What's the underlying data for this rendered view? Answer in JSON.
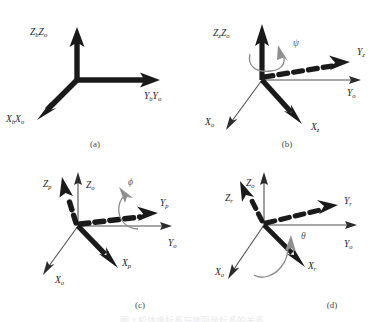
{
  "figure": {
    "background_color": "#ffffff",
    "solid_color": "#1a1a1a",
    "thin_color": "#555555",
    "angle_color": "#8a8a8a",
    "bottom_caption": "图 2  机体坐标系与地面坐标系的关系",
    "panels": [
      {
        "id": "a",
        "caption": "(a)",
        "labels": [
          {
            "name": "z-axis-label",
            "base": "Z",
            "sub": "b",
            "base2": "Z",
            "sub2": "o",
            "x": 30,
            "y": 35
          },
          {
            "name": "y-axis-label",
            "base": "Y",
            "sub": "b",
            "base2": "Y",
            "sub2": "o",
            "x": 144,
            "y": 99
          },
          {
            "name": "x-axis-label",
            "base": "X",
            "sub": "b",
            "base2": "X",
            "sub2": "o",
            "x": 6,
            "y": 122
          }
        ]
      },
      {
        "id": "b",
        "caption": "(b)",
        "angle_symbol": "ψ",
        "labels": [
          {
            "name": "z-axis-label",
            "base": "Z",
            "sub": "z",
            "base2": "Z",
            "sub2": "o",
            "x": 21,
            "y": 36
          },
          {
            "name": "y-body-label",
            "base": "Y",
            "sub": "z",
            "x": 165,
            "y": 55
          },
          {
            "name": "y-ground-label",
            "base": "Y",
            "sub": "o",
            "x": 155,
            "y": 96
          },
          {
            "name": "x-ground-label",
            "base": "X",
            "sub": "o",
            "x": 13,
            "y": 125
          },
          {
            "name": "x-body-label",
            "base": "X",
            "sub": "z",
            "x": 119,
            "y": 130
          }
        ]
      },
      {
        "id": "c",
        "caption": "(c)",
        "angle_symbol": "ϕ",
        "labels": [
          {
            "name": "z-body-label",
            "base": "Z",
            "sub": "p",
            "x": 43,
            "y": 26
          },
          {
            "name": "z-ground-label",
            "base": "Z",
            "sub": "o",
            "x": 86,
            "y": 27
          },
          {
            "name": "y-body-label",
            "base": "Y",
            "sub": "p",
            "x": 160,
            "y": 45
          },
          {
            "name": "y-ground-label",
            "base": "Y",
            "sub": "o",
            "x": 168,
            "y": 85
          },
          {
            "name": "x-body-label",
            "base": "X",
            "sub": "p",
            "x": 122,
            "y": 105
          },
          {
            "name": "x-ground-label",
            "base": "X",
            "sub": "o",
            "x": 55,
            "y": 122
          }
        ]
      },
      {
        "id": "d",
        "caption": "(d)",
        "angle_symbol": "θ",
        "labels": [
          {
            "name": "z-ground-label",
            "base": "Z",
            "sub": "o",
            "x": 54,
            "y": 25
          },
          {
            "name": "z-body-label",
            "base": "Z",
            "sub": "r",
            "x": 33,
            "y": 40
          },
          {
            "name": "y-body-label",
            "base": "Y",
            "sub": "r",
            "x": 152,
            "y": 43
          },
          {
            "name": "y-ground-label",
            "base": "Y",
            "sub": "o",
            "x": 152,
            "y": 86
          },
          {
            "name": "x-ground-label",
            "base": "X",
            "sub": "o",
            "x": 23,
            "y": 114
          },
          {
            "name": "x-body-label",
            "base": "X",
            "sub": "r",
            "x": 116,
            "y": 108
          }
        ]
      }
    ]
  }
}
